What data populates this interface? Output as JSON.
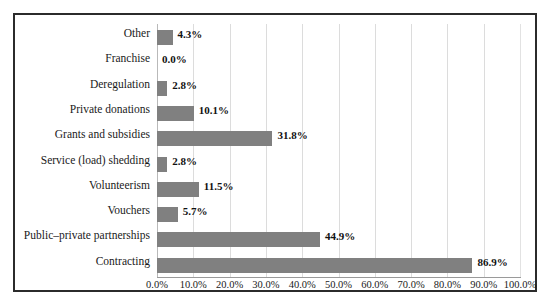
{
  "chart_data": {
    "type": "bar",
    "orientation": "horizontal",
    "title": "",
    "xlabel": "",
    "ylabel": "",
    "xlim": [
      0,
      100
    ],
    "grid": true,
    "legend": false,
    "bar_color": "#808080",
    "categories": [
      "Other",
      "Franchise",
      "Deregulation",
      "Private donations",
      "Grants and subsidies",
      "Service (load) shedding",
      "Volunteerism",
      "Vouchers",
      "Public–private partnerships",
      "Contracting"
    ],
    "values": [
      4.3,
      0.0,
      2.8,
      10.1,
      31.8,
      2.8,
      11.5,
      5.7,
      44.9,
      86.9
    ],
    "data_labels": [
      "4.3%",
      "0.0%",
      "2.8%",
      "10.1%",
      "31.8%",
      "2.8%",
      "11.5%",
      "5.7%",
      "44.9%",
      "86.9%"
    ],
    "xticks": [
      0,
      10,
      20,
      30,
      40,
      50,
      60,
      70,
      80,
      90,
      100
    ],
    "xticklabels": [
      "0.0%",
      "10.0%",
      "20.0%",
      "30.0%",
      "40.0%",
      "50.0%",
      "60.0%",
      "70.0%",
      "80.0%",
      "90.0%",
      "100.0%"
    ]
  }
}
